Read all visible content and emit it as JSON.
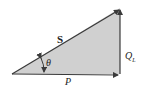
{
  "diagram": {
    "labels": {
      "hypotenuse": "S",
      "vertical": "Q",
      "vertical_sub": "L",
      "horizontal": "P",
      "angle": "θ"
    },
    "colors": {
      "fill": "#cfcfcf",
      "stroke": "#3a3a3a"
    }
  }
}
